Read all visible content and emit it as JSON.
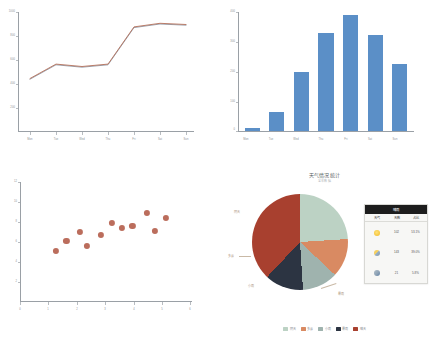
{
  "chart_data": [
    {
      "type": "line",
      "id": "weekly-trend",
      "title": "",
      "xlabel": "",
      "ylabel": "",
      "categories": [
        "Mon",
        "Tue",
        "Wed",
        "Thu",
        "Fri",
        "Sat",
        "Sun"
      ],
      "ytick_labels": [
        "0",
        "200",
        "400",
        "600",
        "800",
        "1000"
      ],
      "ylim": [
        0,
        1000
      ],
      "grid": false,
      "legend": "none",
      "series": [
        {
          "name": "Series A",
          "color": "#8e99a6",
          "values": [
            440,
            560,
            540,
            560,
            870,
            900,
            890
          ]
        },
        {
          "name": "Series B",
          "color": "#b5705a",
          "values": [
            440,
            560,
            540,
            560,
            870,
            900,
            890
          ]
        }
      ]
    },
    {
      "type": "bar",
      "id": "weekly-volume",
      "title": "",
      "xlabel": "",
      "ylabel": "",
      "categories": [
        "Mon",
        "Tue",
        "Wed",
        "Thu",
        "Fri",
        "Sat",
        "Sun"
      ],
      "values": [
        10,
        65,
        200,
        330,
        390,
        325,
        225
      ],
      "ytick_labels": [
        "0",
        "100",
        "200",
        "300",
        "400"
      ],
      "ylim": [
        0,
        400
      ],
      "grid": false,
      "legend": "none",
      "bar_color": "#5b8fc7"
    },
    {
      "type": "scatter",
      "id": "correlation-scatter",
      "title": "",
      "xlabel": "",
      "ylabel": "",
      "xtick_labels": [
        "0",
        "1",
        "2",
        "3",
        "4",
        "5",
        "6"
      ],
      "ytick_labels": [
        "0",
        "2",
        "4",
        "6",
        "8",
        "10",
        "12"
      ],
      "xlim": [
        0,
        6
      ],
      "ylim": [
        0,
        12
      ],
      "grid": false,
      "legend": "none",
      "point_color": "#b5614e",
      "points": [
        {
          "x": 1.25,
          "y": 5.1
        },
        {
          "x": 1.62,
          "y": 6.1
        },
        {
          "x": 2.08,
          "y": 7.0
        },
        {
          "x": 2.33,
          "y": 5.6
        },
        {
          "x": 2.82,
          "y": 6.7
        },
        {
          "x": 3.2,
          "y": 7.9
        },
        {
          "x": 3.56,
          "y": 7.4
        },
        {
          "x": 3.92,
          "y": 7.6
        },
        {
          "x": 4.44,
          "y": 8.9
        },
        {
          "x": 4.7,
          "y": 7.1
        },
        {
          "x": 5.1,
          "y": 8.4
        }
      ]
    },
    {
      "type": "pie",
      "id": "weather-pie",
      "title": "天气情况统计",
      "subtitle": "全年数据",
      "legend": "bottom",
      "labels": [
        "阴天",
        "多云",
        "小雨",
        "暴雨",
        "晴天"
      ],
      "values": [
        24,
        13,
        12,
        13,
        38
      ],
      "colors": [
        "#bcd2c4",
        "#d98a62",
        "#9fb3ae",
        "#2c3442",
        "#a8402f"
      ],
      "callout_labels": [
        {
          "text": "阴天",
          "slice": "阴天"
        },
        {
          "text": "多云",
          "slice": "多云"
        },
        {
          "text": "小雨",
          "slice": "小雨"
        },
        {
          "text": "暴雨",
          "slice": "暴雨"
        }
      ]
    }
  ],
  "line_chart": {
    "name": "line-chart-panel",
    "x_ticks": [
      "Mon",
      "Tue",
      "Wed",
      "Thu",
      "Fri",
      "Sat",
      "Sun"
    ],
    "y_ticks": [
      "1000",
      "800",
      "600",
      "400",
      "200",
      "0"
    ]
  },
  "bar_chart": {
    "name": "bar-chart-panel",
    "x_ticks": [
      "Mon",
      "Tue",
      "Wed",
      "Thu",
      "Fri",
      "Sat",
      "Sun"
    ],
    "y_ticks": [
      "400",
      "300",
      "200",
      "100",
      "0"
    ]
  },
  "scatter_chart": {
    "name": "scatter-chart-panel",
    "x_ticks": [
      "0",
      "1",
      "2",
      "3",
      "4",
      "5",
      "6"
    ],
    "y_ticks": [
      "12",
      "10",
      "8",
      "6",
      "4",
      "2",
      "0"
    ]
  },
  "pie_chart": {
    "title": "天气情况统计",
    "subtitle": "全年数据",
    "slice_labels": {
      "overcast": "阴天",
      "cloudy": "多云",
      "light_rain": "小雨",
      "storm": "暴雨",
      "sunny": "晴天"
    },
    "legend": [
      {
        "label": "阴天",
        "color": "#bcd2c4"
      },
      {
        "label": "多云",
        "color": "#d98a62"
      },
      {
        "label": "小雨",
        "color": "#9fb3ae"
      },
      {
        "label": "暴雨",
        "color": "#2c3442"
      },
      {
        "label": "晴天",
        "color": "#a8402f"
      }
    ],
    "table": {
      "caption": "晴雨",
      "columns": [
        "天气",
        "天数",
        "占比"
      ],
      "rows": [
        {
          "icon": "sun-icon",
          "icon_class": "sun",
          "days": "102",
          "pct": "53.1%"
        },
        {
          "icon": "cloud-sun-icon",
          "icon_class": "cloudsun",
          "days": "143",
          "pct": "39.0%"
        },
        {
          "icon": "rain-icon",
          "icon_class": "rain",
          "days": "21",
          "pct": "5.8%"
        }
      ]
    }
  }
}
